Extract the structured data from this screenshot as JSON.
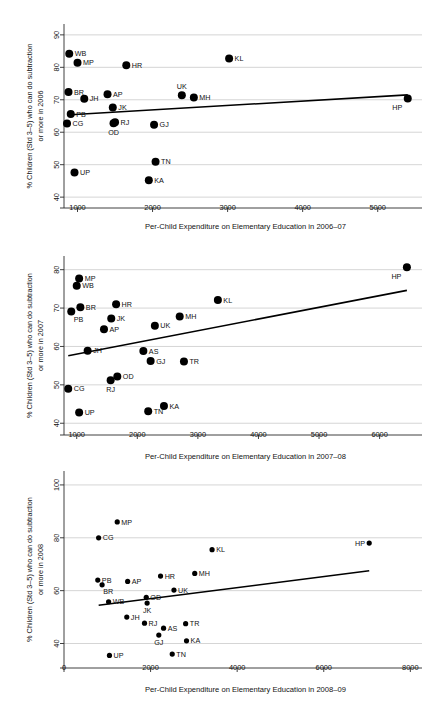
{
  "figure": {
    "type": "multi-panel-scatter",
    "panel_count": 3,
    "marker_color": "#000000",
    "grid_color": "#b9b9b9",
    "background": "#ffffff"
  },
  "chart_data": [
    {
      "type": "scatter",
      "panel": 1,
      "title": "",
      "xlabel": "Per-Child Expenditure on Elementary Education in 2006–07",
      "ylabel": "% Children (Std 3–5) who can do subtraction or more in 2006",
      "ylabel_line1": "% Children (Std 3–5) who can do subtraction",
      "ylabel_line2": "or more in 2006",
      "xlim": [
        820,
        5550
      ],
      "ylim": [
        38.5,
        91.5
      ],
      "xticks": [
        1000,
        2000,
        3000,
        4000,
        5000
      ],
      "yticks": [
        40,
        50,
        60,
        70,
        80,
        90
      ],
      "xtick_labels": [
        "1000",
        "2000",
        "3000",
        "4000",
        "5000"
      ],
      "ytick_labels": [
        "40",
        "50",
        "60",
        "70",
        "80",
        "90"
      ],
      "grid": "horizontal",
      "legend": "none",
      "fit_line": {
        "x1": 905,
        "y1": 65.4,
        "x2": 5400,
        "y2": 71.5
      },
      "points": [
        {
          "label": "WB",
          "x": 890,
          "y": 84.2,
          "lpos": "right"
        },
        {
          "label": "MP",
          "x": 1000,
          "y": 81.4,
          "lpos": "right"
        },
        {
          "label": "HR",
          "x": 1650,
          "y": 80.6,
          "lpos": "right"
        },
        {
          "label": "KL",
          "x": 3020,
          "y": 82.7,
          "lpos": "right"
        },
        {
          "label": "BR",
          "x": 880,
          "y": 72.4,
          "lpos": "right"
        },
        {
          "label": "JH",
          "x": 1090,
          "y": 70.3,
          "lpos": "right"
        },
        {
          "label": "AP",
          "x": 1400,
          "y": 71.7,
          "lpos": "right"
        },
        {
          "label": "UK",
          "x": 2390,
          "y": 71.4,
          "lpos": "above"
        },
        {
          "label": "MH",
          "x": 2550,
          "y": 70.7,
          "lpos": "right"
        },
        {
          "label": "HP",
          "x": 5400,
          "y": 70.4,
          "lpos": "belowleft"
        },
        {
          "label": "PB",
          "x": 910,
          "y": 65.6,
          "lpos": "right"
        },
        {
          "label": "JK",
          "x": 1470,
          "y": 67.6,
          "lpos": "right"
        },
        {
          "label": "CG",
          "x": 860,
          "y": 62.7,
          "lpos": "right"
        },
        {
          "label": "RJ",
          "x": 1500,
          "y": 63.1,
          "lpos": "right"
        },
        {
          "label": "OD",
          "x": 1480,
          "y": 62.8,
          "lpos": "below"
        },
        {
          "label": "GJ",
          "x": 2020,
          "y": 62.3,
          "lpos": "right"
        },
        {
          "label": "TN",
          "x": 2040,
          "y": 50.9,
          "lpos": "right"
        },
        {
          "label": "UP",
          "x": 960,
          "y": 47.6,
          "lpos": "right"
        },
        {
          "label": "KA",
          "x": 1950,
          "y": 45.2,
          "lpos": "right"
        }
      ]
    },
    {
      "type": "scatter",
      "panel": 2,
      "title": "",
      "xlabel": "Per-Child Expenditure on Elementary Education in 2007–08",
      "ylabel": "% Children (Std 3–5) who can do subtraction or more in 2007",
      "ylabel_line1": "% Children (Std 3–5) who can do subtraction",
      "ylabel_line2": "or more in 2007",
      "xlim": [
        790,
        6650
      ],
      "ylim": [
        38.5,
        82
      ],
      "xticks": [
        1000,
        2000,
        3000,
        4000,
        5000,
        6000
      ],
      "yticks": [
        40,
        50,
        60,
        70,
        80
      ],
      "xtick_labels": [
        "1000",
        "2000",
        "3000",
        "4000",
        "5000",
        "6000"
      ],
      "ytick_labels": [
        "40",
        "50",
        "60",
        "70",
        "80"
      ],
      "grid": "horizontal",
      "legend": "none",
      "fit_line": {
        "x1": 860,
        "y1": 57.6,
        "x2": 6450,
        "y2": 74.6
      },
      "points": [
        {
          "label": "HP",
          "x": 6450,
          "y": 80.6,
          "lpos": "belowleft"
        },
        {
          "label": "MP",
          "x": 1040,
          "y": 77.7,
          "lpos": "right"
        },
        {
          "label": "WB",
          "x": 1000,
          "y": 75.8,
          "lpos": "right"
        },
        {
          "label": "KL",
          "x": 3330,
          "y": 72.1,
          "lpos": "right"
        },
        {
          "label": "HR",
          "x": 1650,
          "y": 71.0,
          "lpos": "right"
        },
        {
          "label": "BR",
          "x": 1060,
          "y": 70.2,
          "lpos": "right"
        },
        {
          "label": "PB",
          "x": 910,
          "y": 69.1,
          "lpos": "belowright"
        },
        {
          "label": "MH",
          "x": 2700,
          "y": 67.8,
          "lpos": "right"
        },
        {
          "label": "JK",
          "x": 1570,
          "y": 67.3,
          "lpos": "right"
        },
        {
          "label": "UK",
          "x": 2290,
          "y": 65.4,
          "lpos": "right"
        },
        {
          "label": "AP",
          "x": 1450,
          "y": 64.5,
          "lpos": "right"
        },
        {
          "label": "JH",
          "x": 1180,
          "y": 58.9,
          "lpos": "right"
        },
        {
          "label": "AS",
          "x": 2100,
          "y": 58.8,
          "lpos": "right"
        },
        {
          "label": "GJ",
          "x": 2220,
          "y": 56.2,
          "lpos": "right"
        },
        {
          "label": "TR",
          "x": 2770,
          "y": 56.1,
          "lpos": "right"
        },
        {
          "label": "OD",
          "x": 1670,
          "y": 52.2,
          "lpos": "right"
        },
        {
          "label": "RJ",
          "x": 1560,
          "y": 51.2,
          "lpos": "below"
        },
        {
          "label": "CG",
          "x": 860,
          "y": 49.0,
          "lpos": "right"
        },
        {
          "label": "KA",
          "x": 2440,
          "y": 44.5,
          "lpos": "right"
        },
        {
          "label": "TN",
          "x": 2180,
          "y": 43.1,
          "lpos": "right"
        },
        {
          "label": "UP",
          "x": 1040,
          "y": 42.8,
          "lpos": "right"
        }
      ]
    },
    {
      "type": "scatter",
      "panel": 3,
      "title": "",
      "xlabel": "Per-Child Expenditure on Elementary Education in 2008–09",
      "ylabel": "% Children (Std 3–5) who can do subtraction or more in 2008",
      "ylabel_line1": "% Children (Std 3–5) who can do subtraction",
      "ylabel_line2": "or more in 2008",
      "xlim": [
        0,
        8200
      ],
      "ylim": [
        33,
        103
      ],
      "xticks": [
        0,
        2000,
        4000,
        6000,
        8000
      ],
      "yticks": [
        40,
        60,
        80,
        100
      ],
      "xtick_labels": [
        "0",
        "2000",
        "4000",
        "6000",
        "8000"
      ],
      "ytick_labels": [
        "40",
        "60",
        "80",
        "100"
      ],
      "grid": "horizontal",
      "legend": "none",
      "fit_line": {
        "x1": 800,
        "y1": 54.5,
        "x2": 7050,
        "y2": 67.5
      },
      "points": [
        {
          "label": "MP",
          "x": 1230,
          "y": 86.0,
          "lpos": "right"
        },
        {
          "label": "CG",
          "x": 800,
          "y": 80.0,
          "lpos": "right"
        },
        {
          "label": "KL",
          "x": 3420,
          "y": 75.5,
          "lpos": "right"
        },
        {
          "label": "HP",
          "x": 7050,
          "y": 78.0,
          "lpos": "left"
        },
        {
          "label": "MH",
          "x": 3020,
          "y": 66.5,
          "lpos": "right"
        },
        {
          "label": "HR",
          "x": 2230,
          "y": 65.5,
          "lpos": "right"
        },
        {
          "label": "PB",
          "x": 780,
          "y": 64.0,
          "lpos": "right"
        },
        {
          "label": "AP",
          "x": 1470,
          "y": 63.5,
          "lpos": "right"
        },
        {
          "label": "BR",
          "x": 880,
          "y": 62.2,
          "lpos": "belowright"
        },
        {
          "label": "UK",
          "x": 2540,
          "y": 60.2,
          "lpos": "right"
        },
        {
          "label": "OD",
          "x": 1900,
          "y": 57.5,
          "lpos": "right"
        },
        {
          "label": "WB",
          "x": 1030,
          "y": 55.8,
          "lpos": "right"
        },
        {
          "label": "JK",
          "x": 1920,
          "y": 55.3,
          "lpos": "below"
        },
        {
          "label": "JH",
          "x": 1450,
          "y": 50.0,
          "lpos": "right"
        },
        {
          "label": "RJ",
          "x": 1860,
          "y": 47.7,
          "lpos": "right"
        },
        {
          "label": "TR",
          "x": 2810,
          "y": 47.5,
          "lpos": "right"
        },
        {
          "label": "AS",
          "x": 2300,
          "y": 45.8,
          "lpos": "right"
        },
        {
          "label": "GJ",
          "x": 2190,
          "y": 43.2,
          "lpos": "below"
        },
        {
          "label": "KA",
          "x": 2830,
          "y": 41.0,
          "lpos": "right"
        },
        {
          "label": "TN",
          "x": 2500,
          "y": 36.0,
          "lpos": "right"
        },
        {
          "label": "UP",
          "x": 1050,
          "y": 35.5,
          "lpos": "right"
        }
      ]
    }
  ]
}
